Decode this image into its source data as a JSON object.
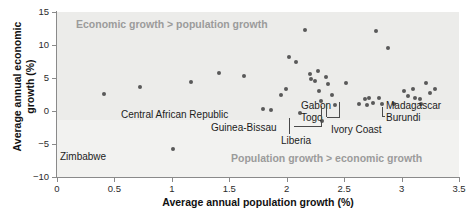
{
  "chart_data": {
    "type": "scatter",
    "title": "",
    "xlabel": "Average annual population growth (%)",
    "ylabel": "Average annual economic growth (%)",
    "xlim": [
      0,
      3.5
    ],
    "ylim": [
      -10,
      15
    ],
    "xticks": [
      "0",
      "0.5",
      "1",
      "1.5",
      "2",
      "2.5",
      "3",
      "3.5"
    ],
    "xtick_values": [
      0,
      0.5,
      1,
      1.5,
      2,
      2.5,
      3,
      3.5
    ],
    "yticks": [
      "15",
      "10",
      "5",
      "0",
      "-5",
      "-10"
    ],
    "ytick_values": [
      15,
      10,
      5,
      0,
      -5,
      -10
    ],
    "grid": false,
    "legend": null,
    "annotations": [
      {
        "name": "upper-region-note",
        "text": "Economic growth > population growth",
        "x": 0.18,
        "y": 13.2
      },
      {
        "name": "lower-region-note",
        "text": "Population growth > economic growth",
        "x": 1.52,
        "y": -7.4
      }
    ],
    "points": [
      {
        "x": 0.41,
        "y": 2.6
      },
      {
        "x": 0.72,
        "y": 3.6
      },
      {
        "x": 1.01,
        "y": -5.7,
        "label": "Zimbabwe"
      },
      {
        "x": 1.17,
        "y": 4.4
      },
      {
        "x": 1.41,
        "y": 5.7
      },
      {
        "x": 1.63,
        "y": 5.3
      },
      {
        "x": 1.79,
        "y": 0.3,
        "label": "Central African Republic"
      },
      {
        "x": 1.86,
        "y": 0.2
      },
      {
        "x": 1.95,
        "y": 2.5
      },
      {
        "x": 1.99,
        "y": 3.3
      },
      {
        "x": 2.02,
        "y": 8.2
      },
      {
        "x": 2.08,
        "y": 7.5
      },
      {
        "x": 2.12,
        "y": -0.3,
        "label": "Guinea-Bissau"
      },
      {
        "x": 2.16,
        "y": 12.3
      },
      {
        "x": 2.2,
        "y": 5.6
      },
      {
        "x": 2.21,
        "y": 4.9
      },
      {
        "x": 2.25,
        "y": 4.6
      },
      {
        "x": 2.27,
        "y": 6.0
      },
      {
        "x": 2.28,
        "y": 3.0
      },
      {
        "x": 2.3,
        "y": 1.5
      },
      {
        "x": 2.31,
        "y": -1.5,
        "label": "Liberia"
      },
      {
        "x": 2.34,
        "y": 5.2
      },
      {
        "x": 2.36,
        "y": 4.1
      },
      {
        "x": 2.39,
        "y": 2.4
      },
      {
        "x": 2.42,
        "y": 0.9,
        "label": "Gabon"
      },
      {
        "x": 2.52,
        "y": 4.3
      },
      {
        "x": 2.63,
        "y": 1.0,
        "label": "Togo"
      },
      {
        "x": 2.68,
        "y": 1.8
      },
      {
        "x": 2.7,
        "y": 0.9
      },
      {
        "x": 2.72,
        "y": 2.0
      },
      {
        "x": 2.75,
        "y": 1.2,
        "label": "Ivory Coast"
      },
      {
        "x": 2.78,
        "y": 12.1
      },
      {
        "x": 2.8,
        "y": 1.9
      },
      {
        "x": 2.83,
        "y": 1.0
      },
      {
        "x": 2.88,
        "y": 9.5
      },
      {
        "x": 2.93,
        "y": 1.0,
        "label": "Burundi"
      },
      {
        "x": 3.02,
        "y": 3.0
      },
      {
        "x": 3.06,
        "y": 2.2
      },
      {
        "x": 3.1,
        "y": 3.4
      },
      {
        "x": 3.12,
        "y": 1.9
      },
      {
        "x": 3.16,
        "y": 1.8
      },
      {
        "x": 3.17,
        "y": 1.0,
        "label": "Madagascar"
      },
      {
        "x": 3.21,
        "y": 4.2
      },
      {
        "x": 3.25,
        "y": 2.8
      },
      {
        "x": 3.29,
        "y": 3.4
      }
    ],
    "labeled_countries": [
      "Zimbabwe",
      "Central African Republic",
      "Guinea-Bissau",
      "Liberia",
      "Gabon",
      "Togo",
      "Ivory Coast",
      "Burundi",
      "Madagascar"
    ]
  },
  "axes": {
    "x_title": "Average annual population growth (%)",
    "y_title_line1": "Average annual economic",
    "y_title_line2": "growth (%)",
    "x_ticks": [
      "0",
      "0.5",
      "1",
      "1.5",
      "2",
      "2.5",
      "3",
      "3.5"
    ],
    "y_ticks": [
      "15",
      "10",
      "5",
      "0",
      "−5",
      "−10"
    ]
  },
  "notes": {
    "upper": "Economic growth > population growth",
    "lower": "Population growth > economic growth"
  },
  "labels": {
    "zimbabwe": "Zimbabwe",
    "central_african_republic": "Central African Republic",
    "guinea_bissau": "Guinea-Bissau",
    "liberia": "Liberia",
    "gabon": "Gabon",
    "togo": "Togo",
    "ivory_coast": "Ivory Coast",
    "burundi": "Burundi",
    "madagascar": "Madagascar"
  },
  "colors": {
    "point": "#595959",
    "plot_background": "#f2f2f0",
    "upper_band": "#ececea",
    "axis": "#8a8a8a",
    "note_text": "#9b9b9b",
    "label_text": "#1c1c1c"
  }
}
